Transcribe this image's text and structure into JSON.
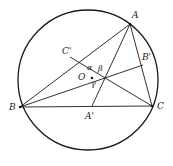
{
  "figure": {
    "background_color": "#ffffff",
    "stroke_color": "#1a1a1a",
    "label_color": "#1a1a1a"
  },
  "circle": {
    "name": "circumscribed-circle",
    "center_x": 88,
    "center_y": 80,
    "radius": 70,
    "stroke_width": 1.3
  },
  "points": {
    "A": {
      "label": "A",
      "x": 130,
      "y": 24,
      "label_x": 132,
      "label_y": 11
    },
    "B": {
      "label": "B",
      "x": 20,
      "y": 107,
      "label_x": 9,
      "label_y": 103
    },
    "C": {
      "label": "C",
      "x": 152,
      "y": 106,
      "label_x": 157,
      "label_y": 102
    },
    "O": {
      "label": "O",
      "x": 92,
      "y": 78,
      "label_x": 78,
      "label_y": 73
    },
    "Ap": {
      "label": "A'",
      "x": 92,
      "y": 106,
      "label_x": 85,
      "label_y": 112
    },
    "Bp": {
      "label": "B'",
      "x": 143,
      "y": 65,
      "label_x": 142,
      "label_y": 53
    },
    "Cp": {
      "label": "C'",
      "x": 70,
      "y": 57,
      "label_x": 62,
      "label_y": 47
    }
  },
  "angles": {
    "alpha": {
      "label": "α",
      "x": 87,
      "y": 64
    },
    "beta": {
      "label": "β",
      "x": 98,
      "y": 65
    },
    "gamma": {
      "label": "γ",
      "x": 91,
      "y": 80
    }
  },
  "segments": [
    {
      "name": "side-AB",
      "from": "A",
      "to": "B"
    },
    {
      "name": "side-BC",
      "from": "B",
      "to": "C"
    },
    {
      "name": "side-CA",
      "from": "C",
      "to": "A"
    },
    {
      "name": "cevian-A-to-Ap",
      "from": "A",
      "to": "Ap"
    },
    {
      "name": "cevian-B-to-Bp",
      "from": "B",
      "to": "Bp"
    },
    {
      "name": "cevian-C-to-Cp",
      "from": "C",
      "to": "Cp"
    }
  ]
}
